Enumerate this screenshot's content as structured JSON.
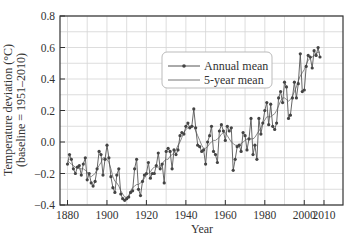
{
  "chart_data": {
    "type": "line",
    "title": "",
    "xlabel": "Year",
    "ylabel": "Temperature deviation (°C)",
    "ylabel_sub": "(baseline = 1951–2010)",
    "xlim": [
      1876,
      2020
    ],
    "ylim": [
      -0.4,
      0.8
    ],
    "x_ticks": [
      1880,
      1900,
      1920,
      1940,
      1960,
      1980,
      2000,
      2010
    ],
    "x_tick_labels": [
      "1880",
      "1900",
      "1920",
      "1940",
      "1960",
      "1980",
      "2000",
      "2010"
    ],
    "y_ticks": [
      -0.4,
      -0.2,
      0.0,
      0.2,
      0.4,
      0.6,
      0.8
    ],
    "y_tick_labels": [
      "−0.4",
      "−0.2",
      "0.0",
      "0.2",
      "0.4",
      "0.6",
      "0.8"
    ],
    "grid": true,
    "legend_position": "upper center-right",
    "legend": [
      "Annual mean",
      "5-year mean"
    ],
    "x": [
      1880,
      1881,
      1882,
      1883,
      1884,
      1885,
      1886,
      1887,
      1888,
      1889,
      1890,
      1891,
      1892,
      1893,
      1894,
      1895,
      1896,
      1897,
      1898,
      1899,
      1900,
      1901,
      1902,
      1903,
      1904,
      1905,
      1906,
      1907,
      1908,
      1909,
      1910,
      1911,
      1912,
      1913,
      1914,
      1915,
      1916,
      1917,
      1918,
      1919,
      1920,
      1921,
      1922,
      1923,
      1924,
      1925,
      1926,
      1927,
      1928,
      1929,
      1930,
      1931,
      1932,
      1933,
      1934,
      1935,
      1936,
      1937,
      1938,
      1939,
      1940,
      1941,
      1942,
      1943,
      1944,
      1945,
      1946,
      1947,
      1948,
      1949,
      1950,
      1951,
      1952,
      1953,
      1954,
      1955,
      1956,
      1957,
      1958,
      1959,
      1960,
      1961,
      1962,
      1963,
      1964,
      1965,
      1966,
      1967,
      1968,
      1969,
      1970,
      1971,
      1972,
      1973,
      1974,
      1975,
      1976,
      1977,
      1978,
      1979,
      1980,
      1981,
      1982,
      1983,
      1984,
      1985,
      1986,
      1987,
      1988,
      1989,
      1990,
      1991,
      1992,
      1993,
      1994,
      1995,
      1996,
      1997,
      1998,
      1999,
      2000,
      2001,
      2002,
      2003,
      2004,
      2005,
      2006,
      2007,
      2008
    ],
    "series": [
      {
        "name": "Annual mean",
        "marker": "dot",
        "values": [
          -0.14,
          -0.08,
          -0.11,
          -0.17,
          -0.2,
          -0.16,
          -0.15,
          -0.21,
          -0.14,
          -0.1,
          -0.24,
          -0.2,
          -0.26,
          -0.28,
          -0.25,
          -0.17,
          -0.06,
          -0.08,
          -0.21,
          -0.11,
          -0.02,
          -0.1,
          -0.22,
          -0.29,
          -0.32,
          -0.21,
          -0.17,
          -0.33,
          -0.36,
          -0.37,
          -0.36,
          -0.35,
          -0.32,
          -0.31,
          -0.17,
          -0.11,
          -0.3,
          -0.34,
          -0.25,
          -0.21,
          -0.2,
          -0.13,
          -0.23,
          -0.2,
          -0.2,
          -0.15,
          -0.07,
          -0.17,
          -0.14,
          -0.26,
          -0.06,
          -0.04,
          -0.06,
          -0.17,
          -0.05,
          -0.08,
          -0.05,
          0.04,
          0.06,
          0.05,
          0.1,
          0.12,
          0.09,
          0.1,
          0.21,
          0.09,
          -0.02,
          -0.03,
          -0.06,
          -0.05,
          -0.14,
          0.0,
          0.04,
          0.1,
          -0.06,
          -0.08,
          -0.13,
          0.07,
          0.11,
          0.07,
          0.01,
          0.1,
          0.07,
          0.09,
          -0.18,
          -0.11,
          -0.03,
          -0.02,
          -0.06,
          0.06,
          0.04,
          -0.05,
          0.02,
          0.15,
          -0.08,
          -0.02,
          -0.11,
          0.15,
          0.05,
          0.12,
          0.2,
          0.25,
          0.11,
          0.24,
          0.1,
          0.08,
          0.12,
          0.28,
          0.32,
          0.25,
          0.38,
          0.35,
          0.15,
          0.17,
          0.28,
          0.38,
          0.28,
          0.37,
          0.56,
          0.32,
          0.33,
          0.48,
          0.55,
          0.54,
          0.47,
          0.58,
          0.55,
          0.6,
          0.54
        ]
      },
      {
        "name": "5-year mean",
        "marker": "none",
        "values": [
          -0.12,
          -0.13,
          -0.14,
          -0.15,
          -0.16,
          -0.16,
          -0.17,
          -0.17,
          -0.17,
          -0.18,
          -0.19,
          -0.21,
          -0.22,
          -0.21,
          -0.2,
          -0.17,
          -0.15,
          -0.13,
          -0.1,
          -0.1,
          -0.11,
          -0.13,
          -0.17,
          -0.22,
          -0.25,
          -0.26,
          -0.28,
          -0.31,
          -0.33,
          -0.35,
          -0.35,
          -0.34,
          -0.31,
          -0.29,
          -0.28,
          -0.27,
          -0.27,
          -0.26,
          -0.25,
          -0.23,
          -0.21,
          -0.2,
          -0.19,
          -0.17,
          -0.16,
          -0.16,
          -0.16,
          -0.15,
          -0.14,
          -0.12,
          -0.11,
          -0.11,
          -0.09,
          -0.08,
          -0.07,
          -0.05,
          -0.02,
          0.0,
          0.03,
          0.06,
          0.08,
          0.09,
          0.1,
          0.1,
          0.1,
          0.07,
          0.04,
          0.01,
          -0.02,
          -0.04,
          -0.04,
          -0.03,
          -0.01,
          0.0,
          0.01,
          0.01,
          0.02,
          0.03,
          0.05,
          0.06,
          0.06,
          0.04,
          0.02,
          0.0,
          -0.01,
          -0.02,
          -0.02,
          -0.02,
          -0.01,
          0.0,
          0.01,
          0.02,
          0.02,
          0.02,
          0.02,
          0.03,
          0.05,
          0.07,
          0.09,
          0.12,
          0.14,
          0.16,
          0.16,
          0.16,
          0.17,
          0.18,
          0.2,
          0.23,
          0.26,
          0.28,
          0.28,
          0.27,
          0.26,
          0.27,
          0.29,
          0.32,
          0.35,
          0.39,
          0.42,
          0.44,
          0.46,
          0.49,
          0.52,
          0.53,
          0.54,
          0.55,
          0.56,
          0.57,
          0.57
        ]
      }
    ]
  }
}
